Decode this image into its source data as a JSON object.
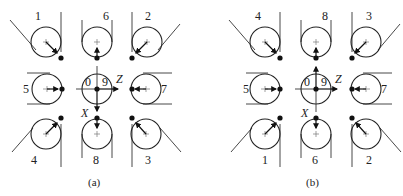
{
  "diagram": {
    "panels": [
      {
        "caption": "(a)",
        "top_labels": [
          "1",
          "6",
          "2"
        ],
        "middle_labels": {
          "left": "5",
          "center_left": "0",
          "center_right": "9",
          "right": "7"
        },
        "bottom_labels": [
          "4",
          "8",
          "3"
        ],
        "axes": {
          "z": "Z",
          "x": "X"
        },
        "x_arrow_direction": "down"
      },
      {
        "caption": "(b)",
        "top_labels": [
          "4",
          "8",
          "3"
        ],
        "middle_labels": {
          "left": "5",
          "center_left": "0",
          "center_right": "9",
          "right": "7"
        },
        "bottom_labels": [
          "1",
          "6",
          "2"
        ],
        "axes": {
          "z": "Z",
          "x": "X"
        },
        "x_arrow_direction": "up"
      }
    ]
  }
}
